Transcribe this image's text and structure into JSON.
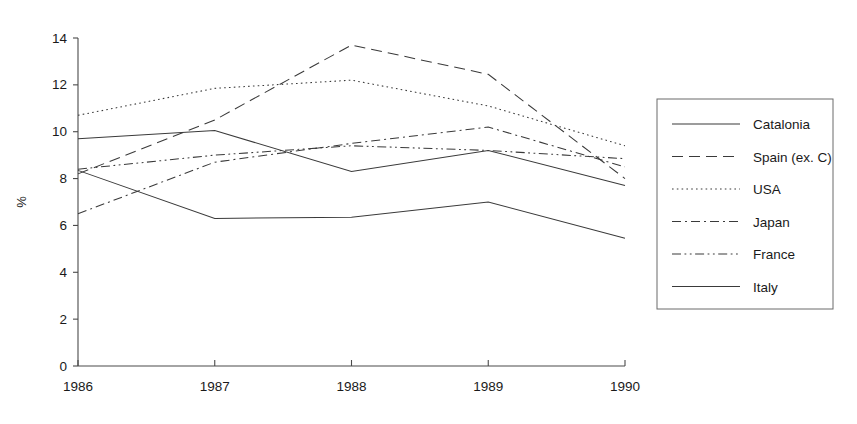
{
  "chart_data": {
    "type": "line",
    "title": "",
    "xlabel": "",
    "ylabel": "%",
    "categories": [
      "1986",
      "1987",
      "1988",
      "1989",
      "1990"
    ],
    "x": [
      1986,
      1987,
      1988,
      1989,
      1990
    ],
    "ylim": [
      0,
      14
    ],
    "xlim": [
      1986,
      1990
    ],
    "yticks": [
      0,
      2,
      4,
      6,
      8,
      10,
      12,
      14
    ],
    "ytick_labels": [
      "0",
      "2",
      "4",
      "6",
      "8",
      "10",
      "12",
      "14"
    ],
    "xtick_labels": [
      "1986",
      "1987",
      "1988",
      "1989",
      "1990"
    ],
    "grid": false,
    "legend_position": "right",
    "series": [
      {
        "name": "Catalonia",
        "style": "solid",
        "color": "#3a3a3a",
        "values": [
          9.7,
          10.05,
          8.3,
          9.2,
          7.7
        ]
      },
      {
        "name": "Spain (ex. C)",
        "style": "dashed",
        "color": "#3a3a3a",
        "values": [
          8.2,
          10.5,
          13.7,
          12.45,
          8.0
        ]
      },
      {
        "name": "USA",
        "style": "dotted",
        "color": "#3a3a3a",
        "values": [
          10.7,
          11.85,
          12.2,
          11.1,
          9.4
        ]
      },
      {
        "name": "Japan",
        "style": "dash-dot",
        "color": "#3a3a3a",
        "values": [
          6.5,
          8.7,
          9.5,
          10.2,
          8.5
        ]
      },
      {
        "name": "France",
        "style": "dash-dot-dot",
        "color": "#3a3a3a",
        "values": [
          8.4,
          9.0,
          9.4,
          9.2,
          8.85
        ]
      },
      {
        "name": "Italy",
        "style": "solid-thin",
        "color": "#3a3a3a",
        "values": [
          8.35,
          6.3,
          6.35,
          7.0,
          5.45
        ]
      }
    ]
  },
  "axes": {
    "y_axis_title": "%",
    "y_ticks": [
      "14",
      "12",
      "10",
      "8",
      "6",
      "4",
      "2",
      "0"
    ],
    "x_ticks": [
      "1986",
      "1987",
      "1988",
      "1989",
      "1990"
    ]
  },
  "legend": {
    "items": [
      {
        "label": "Catalonia"
      },
      {
        "label": "Spain (ex. C)"
      },
      {
        "label": "USA"
      },
      {
        "label": "Japan"
      },
      {
        "label": "France"
      },
      {
        "label": "Italy"
      }
    ]
  },
  "header": {
    "title_fragment": ""
  }
}
